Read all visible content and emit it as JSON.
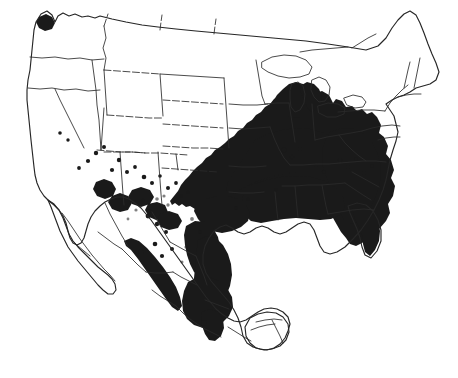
{
  "figure": {
    "kind": "species-distribution-map",
    "title": "",
    "caption": "",
    "region_name": "North America",
    "width_px": 458,
    "height_px": 378,
    "background_color": "#ffffff",
    "range_fill_color": "#1a1a1a",
    "boundary_line_color": "#2b2b2b",
    "outline_line_color": "#262626",
    "has_visible_text": false,
    "has_border_frame": false
  },
  "legend": {
    "visible": false,
    "entries": [
      {
        "symbol": "solid-black-fill",
        "label": ""
      },
      {
        "symbol": "black-dot",
        "label": ""
      }
    ]
  },
  "map": {
    "countries": [
      {
        "name": "United States",
        "id": "usa"
      },
      {
        "name": "Mexico",
        "id": "mexico"
      },
      {
        "name": "Canada",
        "id": "canada-southern-edge"
      }
    ],
    "features": {
      "coastline_outline": "continental outline of North America from Pacific Northwest through California, Baja California, mainland Mexico, Yucatan, Gulf of Mexico, Florida, Atlantic seaboard to Maine and southern Canada",
      "internal_boundaries": "US state boundaries and Mexican state boundaries drawn as thin solid and dashed lines",
      "range_shading": "solid black fill indicating species occurrence"
    },
    "range_regions": [
      {
        "name": "Eastern United States",
        "fill": "solid"
      },
      {
        "name": "Great Lakes / Upper Midwest",
        "fill": "solid"
      },
      {
        "name": "Ohio River Valley",
        "fill": "solid"
      },
      {
        "name": "Appalachians and Southeast",
        "fill": "solid"
      },
      {
        "name": "Florida Peninsula",
        "fill": "solid"
      },
      {
        "name": "Gulf Coastal Plain",
        "fill": "solid"
      },
      {
        "name": "Eastern Texas",
        "fill": "solid"
      },
      {
        "name": "Eastern Mexico / Sierra Madre Oriental",
        "fill": "solid"
      },
      {
        "name": "Southern Mexico / Oaxaca",
        "fill": "solid"
      },
      {
        "name": "Sierra Madre Occidental",
        "fill": "solid"
      },
      {
        "name": "Arizona / New Mexico Sky Islands",
        "fill": "scattered"
      },
      {
        "name": "Western Washington",
        "fill": "small-patch"
      }
    ],
    "scattered_dot_regions": [
      {
        "name": "Great Basin",
        "count_visible": 4
      },
      {
        "name": "Arizona highlands",
        "count_visible": 6
      },
      {
        "name": "New Mexico highlands",
        "count_visible": 5
      },
      {
        "name": "Central Mexican Plateau",
        "count_visible": 4
      },
      {
        "name": "Southern Mexico",
        "count_visible": 2
      }
    ]
  }
}
